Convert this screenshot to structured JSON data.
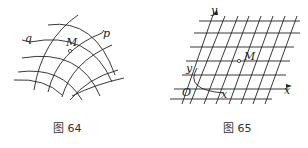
{
  "figures": [
    {
      "caption": "图 64",
      "type": "curvilinear-grid",
      "labels": {
        "q": "q",
        "p": "p",
        "M": "M"
      }
    },
    {
      "caption": "图 65",
      "type": "oblique-coordinate-grid",
      "labels": {
        "y_axis": "y",
        "x_axis": "x",
        "origin": "O",
        "M": "M",
        "y_coord": "y",
        "x_coord": "x"
      }
    }
  ],
  "colors": {
    "line": "#222222",
    "background": "#ffffff"
  }
}
